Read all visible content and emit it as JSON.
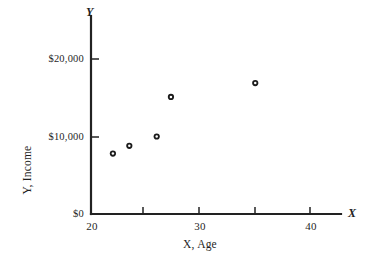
{
  "chart_data": {
    "type": "scatter",
    "title": "",
    "xlabel": "X, Age",
    "ylabel": "Y, Income",
    "x_axis_letter": "Y",
    "y_axis_letter": "X",
    "xlim": [
      20,
      43
    ],
    "ylim": [
      0,
      23000
    ],
    "grid": false,
    "legend": null,
    "x_ticks": [
      {
        "value": 20,
        "label": "20"
      },
      {
        "value": 25,
        "label": ""
      },
      {
        "value": 30,
        "label": "30"
      },
      {
        "value": 35,
        "label": ""
      },
      {
        "value": 40,
        "label": "40"
      }
    ],
    "y_ticks": [
      {
        "value": 0,
        "label": "$0"
      },
      {
        "value": 10000,
        "label": "$10,000"
      },
      {
        "value": 20000,
        "label": "$20,000"
      }
    ],
    "x": [
      22.0,
      23.5,
      26.0,
      27.3,
      35.0
    ],
    "y": [
      7800,
      8800,
      10000,
      15100,
      16900
    ],
    "points": [
      {
        "x": 22.0,
        "y": 7800
      },
      {
        "x": 23.5,
        "y": 8800
      },
      {
        "x": 26.0,
        "y": 10000
      },
      {
        "x": 27.3,
        "y": 15100
      },
      {
        "x": 35.0,
        "y": 16900
      }
    ],
    "marker": "open-circle",
    "marker_color": "#1b1b1b",
    "axis_color": "#222222"
  },
  "labels": {
    "y_axis_letter": "Y",
    "x_axis_letter": "X",
    "y_axis_title": "Y, Income",
    "x_axis_title": "X, Age",
    "y_tick_0": "$0",
    "y_tick_1": "$10,000",
    "y_tick_2": "$20,000",
    "x_tick_0": "20",
    "x_tick_1": "30",
    "x_tick_2": "40"
  }
}
